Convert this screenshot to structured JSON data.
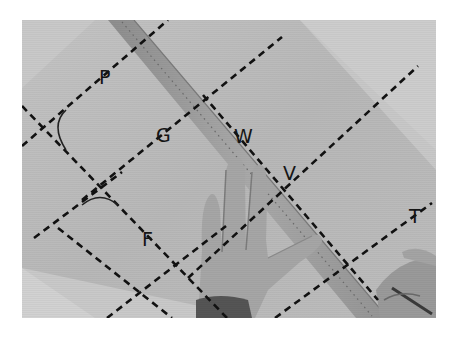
{
  "figure": {
    "photo_bounds": {
      "x": 22,
      "y": 20,
      "w": 414,
      "h": 298
    },
    "colors": {
      "background": "#ffffff",
      "paper": "#b9b9b9",
      "paper_light": "#cdcdcd",
      "ruler": "#9e9e9e",
      "ruler_edge": "#7d7d7d",
      "hand": "#a8a8a8",
      "hand_shadow": "#6e6e6e",
      "sleeve": "#555555",
      "line": "#111111"
    },
    "labels": [
      {
        "id": "P",
        "text": "P",
        "x": 99,
        "y": 84
      },
      {
        "id": "G",
        "text": "G",
        "x": 156,
        "y": 142
      },
      {
        "id": "W",
        "text": "W",
        "x": 234,
        "y": 143
      },
      {
        "id": "V",
        "text": "V",
        "x": 283,
        "y": 180
      },
      {
        "id": "F",
        "text": "F",
        "x": 142,
        "y": 246
      },
      {
        "id": "T",
        "text": "T",
        "x": 409,
        "y": 223
      }
    ],
    "dashed_lines": [
      {
        "id": "line-p",
        "x1": 22,
        "y1": 146,
        "x2": 168,
        "y2": 20
      },
      {
        "id": "line-g",
        "x1": 82,
        "y1": 200,
        "x2": 282,
        "y2": 37
      },
      {
        "id": "line-v",
        "x1": 188,
        "y1": 278,
        "x2": 418,
        "y2": 66
      },
      {
        "id": "line-t",
        "x1": 275,
        "y1": 318,
        "x2": 432,
        "y2": 203
      },
      {
        "id": "line-lower-left",
        "x1": 34,
        "y1": 238,
        "x2": 122,
        "y2": 172
      },
      {
        "id": "line-lower-mid",
        "x1": 107,
        "y1": 318,
        "x2": 226,
        "y2": 226
      },
      {
        "id": "line-diag-top",
        "x1": 22,
        "y1": 106,
        "x2": 227,
        "y2": 318
      },
      {
        "id": "line-diag-low",
        "x1": 58,
        "y1": 228,
        "x2": 172,
        "y2": 318
      },
      {
        "id": "line-ruler-edge",
        "x1": 203,
        "y1": 95,
        "x2": 378,
        "y2": 300
      }
    ],
    "arcs": [
      {
        "id": "arc-left",
        "d": "M 66 110 Q 50 125 66 150"
      },
      {
        "id": "arc-mid",
        "d": "M 82 205 Q 100 190 118 205"
      }
    ]
  }
}
